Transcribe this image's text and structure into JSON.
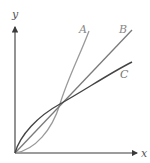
{
  "diagram": {
    "axes": {
      "x_label": "x",
      "y_label": "y",
      "color": "#3a3a3a"
    },
    "curves": [
      {
        "id": "A",
        "label": "A",
        "color": "#9a9a9a",
        "shape": "convex (increasing slope)"
      },
      {
        "id": "B",
        "label": "B",
        "color": "#7a7a7a",
        "shape": "linear"
      },
      {
        "id": "C",
        "label": "C",
        "color": "#444444",
        "shape": "concave (decreasing slope)"
      }
    ],
    "note": "All three curves start at the origin and intersect at a common point"
  }
}
